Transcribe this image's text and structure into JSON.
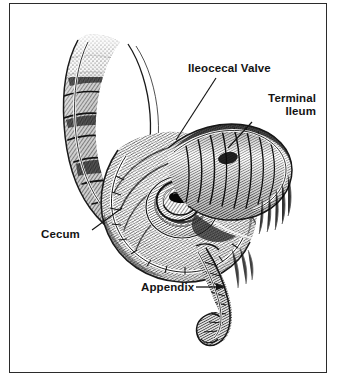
{
  "figure": {
    "style": "black-and-white engraving / line-art medical illustration",
    "background_color": "#ffffff",
    "ink_color": "#141414",
    "frame": {
      "visible": true,
      "color": "#2b2b2b"
    }
  },
  "labels": {
    "ileocecal_valve": "Ileocecal Valve",
    "terminal_ileum_line1": "Terminal",
    "terminal_ileum_line2": "Ileum",
    "cecum": "Cecum",
    "appendix": "Appendix"
  },
  "structures": [
    {
      "name": "ascending-colon",
      "description": "Ascending colon with haustral folds, upper left, cut open"
    },
    {
      "name": "cecum",
      "description": "Large blind pouch, center-left, interior exposed"
    },
    {
      "name": "ileocecal-valve",
      "description": "Spiral aperture with lips at center of cecum interior"
    },
    {
      "name": "terminal-ileum",
      "description": "Tubular ileum with circular plicae entering from upper right"
    },
    {
      "name": "appendix",
      "description": "Narrow curved vermiform tube descending from lower cecum"
    }
  ],
  "leaders": [
    {
      "name": "leader-ileocecal-valve",
      "from": "label",
      "to": "ileocecal-valve",
      "style": "diagonal line"
    },
    {
      "name": "leader-terminal-ileum",
      "from": "label",
      "to": "terminal-ileum",
      "style": "diagonal line"
    },
    {
      "name": "leader-cecum",
      "from": "label",
      "to": "cecum",
      "style": "diagonal line"
    },
    {
      "name": "leader-appendix",
      "from": "label",
      "to": "appendix",
      "style": "horizontal arrow"
    }
  ]
}
